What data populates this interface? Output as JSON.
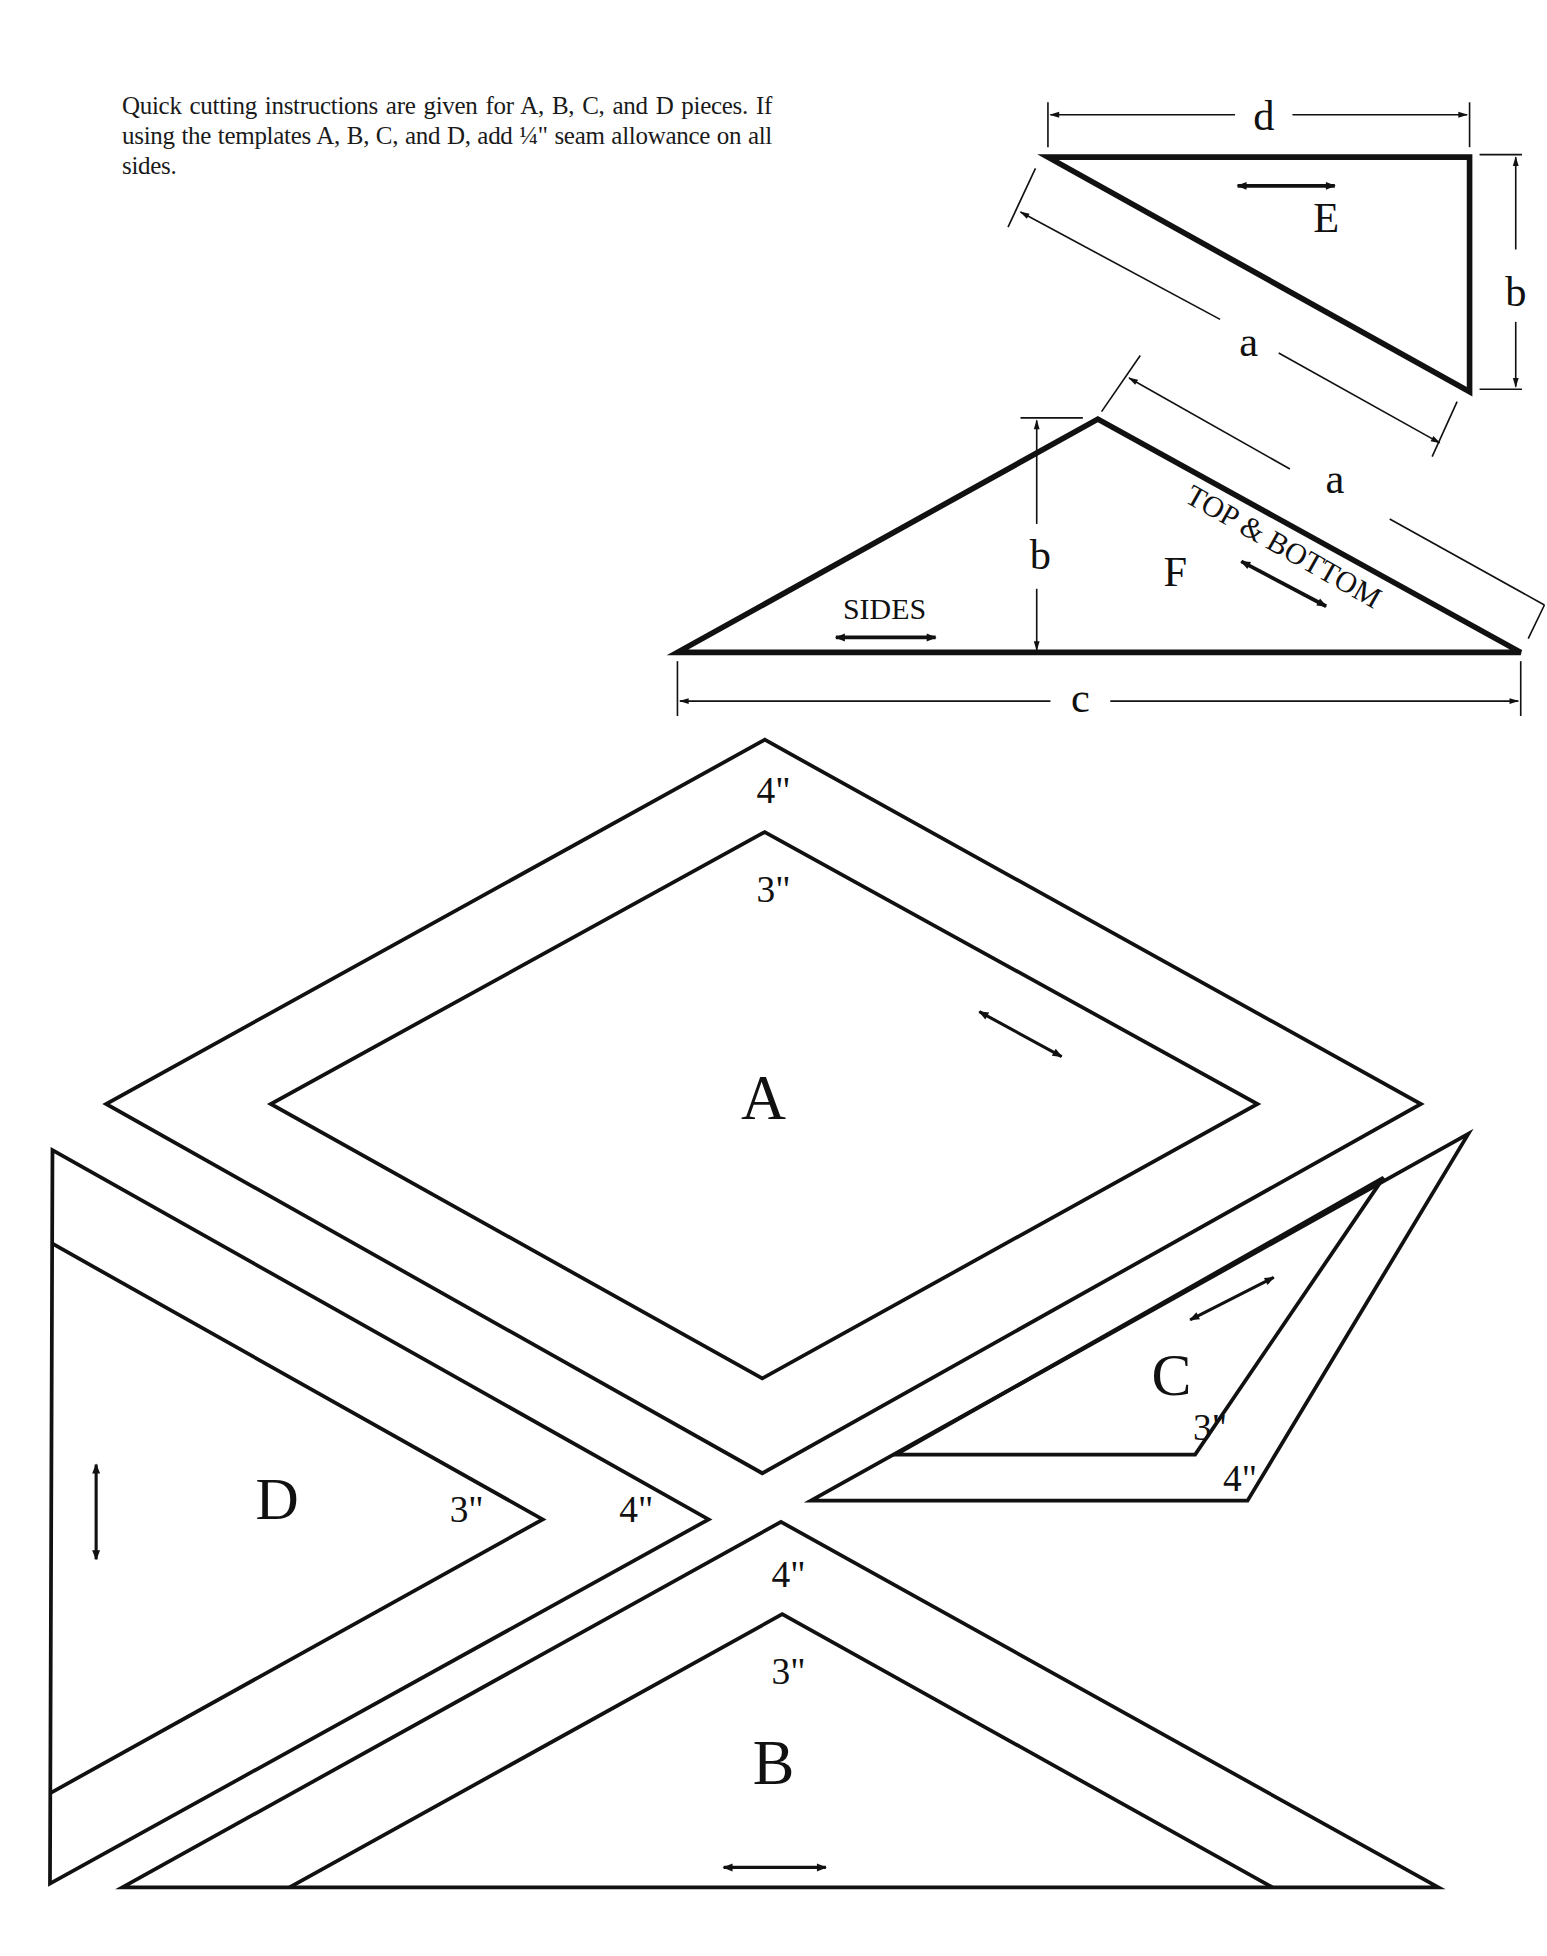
{
  "intro_text": "Quick cutting instructions are given for A, B, C, and D pieces. If using the templates A, B, C, and D, add ¼\" seam allowance on all sides.",
  "pieces": {
    "E": {
      "label": "E",
      "dimensions": {
        "top": "d",
        "right": "b",
        "diagonal": "a"
      }
    },
    "F": {
      "label": "F",
      "dimensions": {
        "height": "b",
        "base": "c",
        "slant": "a"
      },
      "grain_sides": "SIDES",
      "grain_top_bottom": "TOP & BOTTOM"
    },
    "A": {
      "label": "A",
      "outer_size": "4\"",
      "inner_size": "3\""
    },
    "B": {
      "label": "B",
      "outer_size": "4\"",
      "inner_size": "3\""
    },
    "C": {
      "label": "C",
      "outer_size": "4\"",
      "inner_size": "3\""
    },
    "D": {
      "label": "D",
      "outer_size": "4\"",
      "inner_size": "3\""
    }
  },
  "colors": {
    "line": "#111111",
    "background": "#ffffff"
  }
}
